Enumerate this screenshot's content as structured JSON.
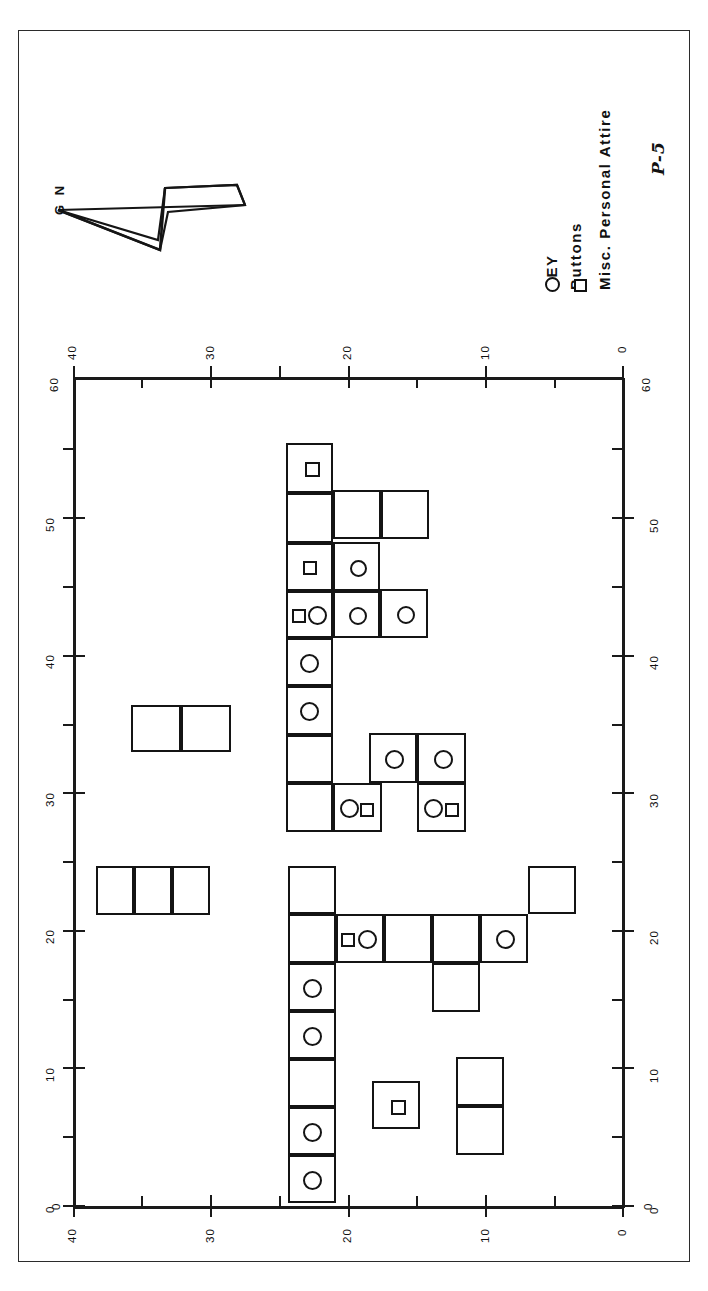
{
  "figure": {
    "caption": "P-5",
    "north_arrow_label": "G N",
    "orientation_note": "map rotated 90 degrees"
  },
  "key": {
    "title": "KEY",
    "entries": [
      {
        "symbol": "circle",
        "label": "Buttons"
      },
      {
        "symbol": "square",
        "label": "Misc. Personal Attire"
      }
    ]
  },
  "axes": {
    "top": {
      "left_end_label": "60",
      "right_end_label": "60",
      "tick_labels": [
        "40",
        "30",
        "20",
        "10",
        "0"
      ]
    },
    "bottom": {
      "left_end_label": "0",
      "right_end_label": "0",
      "tick_labels": [
        "40",
        "30",
        "20",
        "10",
        "0"
      ]
    },
    "left": {
      "tick_labels": [
        "0",
        "10",
        "20",
        "30",
        "40",
        "50"
      ]
    },
    "right": {
      "tick_labels": [
        "0",
        "10",
        "20",
        "30",
        "40",
        "50"
      ]
    },
    "major_tick_values": [
      0,
      10,
      20,
      30,
      40,
      50,
      60
    ],
    "minor_tick_step": 5
  },
  "chart_data": {
    "type": "scatter",
    "title": "",
    "xlabel": "",
    "ylabel": "",
    "xlim": [
      0,
      60
    ],
    "ylim": [
      0,
      60
    ],
    "grid": false,
    "legend": [
      "Buttons",
      "Misc. Personal Attire"
    ],
    "legend_position": "right",
    "note": "Excavation unit grid; each square is one unit. Markers inside units denote recovered artifact classes.",
    "units": [
      {
        "x": 286,
        "y": 443,
        "w": 47,
        "h": 50,
        "markers": [
          {
            "type": "square",
            "dx": 17,
            "dy": 17,
            "size": 15
          }
        ]
      },
      {
        "x": 286,
        "y": 493,
        "w": 47,
        "h": 50,
        "markers": []
      },
      {
        "x": 333,
        "y": 490,
        "w": 48,
        "h": 49,
        "markers": []
      },
      {
        "x": 381,
        "y": 490,
        "w": 48,
        "h": 49,
        "markers": []
      },
      {
        "x": 286,
        "y": 543,
        "w": 47,
        "h": 48,
        "markers": [
          {
            "type": "square",
            "dx": 15,
            "dy": 16,
            "size": 14
          }
        ]
      },
      {
        "x": 333,
        "y": 542,
        "w": 47,
        "h": 49,
        "markers": [
          {
            "type": "circle",
            "dx": 15,
            "dy": 16,
            "size": 17
          }
        ]
      },
      {
        "x": 286,
        "y": 591,
        "w": 47,
        "h": 47,
        "markers": [
          {
            "type": "square",
            "dx": 4,
            "dy": 16,
            "size": 14
          },
          {
            "type": "circle",
            "dx": 20,
            "dy": 13,
            "size": 19
          }
        ]
      },
      {
        "x": 333,
        "y": 591,
        "w": 47,
        "h": 47,
        "markers": [
          {
            "type": "circle",
            "dx": 14,
            "dy": 14,
            "size": 18
          }
        ]
      },
      {
        "x": 380,
        "y": 589,
        "w": 48,
        "h": 49,
        "markers": [
          {
            "type": "circle",
            "dx": 15,
            "dy": 15,
            "size": 18
          }
        ]
      },
      {
        "x": 286,
        "y": 638,
        "w": 47,
        "h": 48,
        "markers": [
          {
            "type": "circle",
            "dx": 12,
            "dy": 14,
            "size": 19
          }
        ]
      },
      {
        "x": 286,
        "y": 686,
        "w": 47,
        "h": 49,
        "markers": [
          {
            "type": "circle",
            "dx": 12,
            "dy": 14,
            "size": 19
          }
        ]
      },
      {
        "x": 286,
        "y": 735,
        "w": 47,
        "h": 48,
        "markers": []
      },
      {
        "x": 369,
        "y": 733,
        "w": 48,
        "h": 50,
        "markers": [
          {
            "type": "circle",
            "dx": 14,
            "dy": 15,
            "size": 19
          }
        ]
      },
      {
        "x": 417,
        "y": 733,
        "w": 49,
        "h": 50,
        "markers": [
          {
            "type": "circle",
            "dx": 15,
            "dy": 15,
            "size": 19
          }
        ]
      },
      {
        "x": 286,
        "y": 783,
        "w": 47,
        "h": 49,
        "markers": []
      },
      {
        "x": 333,
        "y": 783,
        "w": 49,
        "h": 49,
        "markers": [
          {
            "type": "circle",
            "dx": 5,
            "dy": 14,
            "size": 19
          },
          {
            "type": "square",
            "dx": 25,
            "dy": 18,
            "size": 14
          }
        ]
      },
      {
        "x": 417,
        "y": 783,
        "w": 49,
        "h": 49,
        "markers": [
          {
            "type": "circle",
            "dx": 5,
            "dy": 14,
            "size": 19
          },
          {
            "type": "square",
            "dx": 26,
            "dy": 18,
            "size": 14
          }
        ]
      },
      {
        "x": 131,
        "y": 705,
        "w": 50,
        "h": 47,
        "markers": []
      },
      {
        "x": 181,
        "y": 705,
        "w": 50,
        "h": 47,
        "markers": []
      },
      {
        "x": 96,
        "y": 866,
        "w": 38,
        "h": 49,
        "markers": []
      },
      {
        "x": 134,
        "y": 866,
        "w": 38,
        "h": 49,
        "markers": []
      },
      {
        "x": 172,
        "y": 866,
        "w": 38,
        "h": 49,
        "markers": []
      },
      {
        "x": 288,
        "y": 866,
        "w": 48,
        "h": 48,
        "markers": []
      },
      {
        "x": 288,
        "y": 914,
        "w": 48,
        "h": 49,
        "markers": []
      },
      {
        "x": 336,
        "y": 914,
        "w": 48,
        "h": 49,
        "markers": [
          {
            "type": "square",
            "dx": 3,
            "dy": 17,
            "size": 14
          },
          {
            "type": "circle",
            "dx": 20,
            "dy": 14,
            "size": 19
          }
        ]
      },
      {
        "x": 384,
        "y": 914,
        "w": 48,
        "h": 49,
        "markers": []
      },
      {
        "x": 432,
        "y": 914,
        "w": 48,
        "h": 49,
        "markers": []
      },
      {
        "x": 480,
        "y": 914,
        "w": 48,
        "h": 49,
        "markers": [
          {
            "type": "circle",
            "dx": 14,
            "dy": 14,
            "size": 19
          }
        ]
      },
      {
        "x": 528,
        "y": 866,
        "w": 48,
        "h": 48,
        "markers": []
      },
      {
        "x": 432,
        "y": 963,
        "w": 48,
        "h": 49,
        "markers": []
      },
      {
        "x": 288,
        "y": 963,
        "w": 48,
        "h": 48,
        "markers": [
          {
            "type": "circle",
            "dx": 13,
            "dy": 14,
            "size": 19
          }
        ]
      },
      {
        "x": 288,
        "y": 1011,
        "w": 48,
        "h": 48,
        "markers": [
          {
            "type": "circle",
            "dx": 13,
            "dy": 14,
            "size": 19
          }
        ]
      },
      {
        "x": 288,
        "y": 1059,
        "w": 48,
        "h": 48,
        "markers": []
      },
      {
        "x": 288,
        "y": 1107,
        "w": 48,
        "h": 48,
        "markers": [
          {
            "type": "circle",
            "dx": 13,
            "dy": 14,
            "size": 19
          }
        ]
      },
      {
        "x": 288,
        "y": 1155,
        "w": 48,
        "h": 48,
        "markers": [
          {
            "type": "circle",
            "dx": 13,
            "dy": 14,
            "size": 19
          }
        ]
      },
      {
        "x": 372,
        "y": 1081,
        "w": 48,
        "h": 48,
        "markers": [
          {
            "type": "square",
            "dx": 17,
            "dy": 17,
            "size": 15
          }
        ]
      },
      {
        "x": 456,
        "y": 1057,
        "w": 48,
        "h": 49,
        "markers": []
      },
      {
        "x": 456,
        "y": 1106,
        "w": 48,
        "h": 49,
        "markers": []
      }
    ]
  }
}
